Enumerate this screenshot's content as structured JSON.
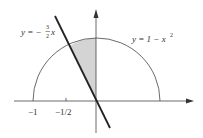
{
  "diagram": {
    "line_label": {
      "prefix": "y = −",
      "num": "3",
      "den": "2",
      "var": "x"
    },
    "curve_label": {
      "text": "y = 1 − x",
      "exp": "2"
    },
    "ticks": [
      {
        "label": "−1"
      },
      {
        "label": "−1/2"
      }
    ],
    "colors": {
      "stroke": "#222222",
      "shade": "#d4d4d4"
    }
  }
}
